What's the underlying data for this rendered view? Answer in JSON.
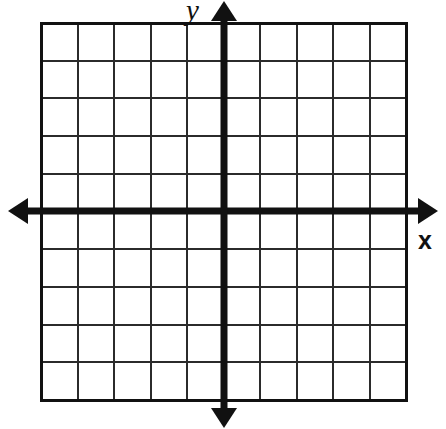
{
  "figure": {
    "kind": "cartesian-coordinate-grid",
    "title": "",
    "background_color": "#ffffff"
  },
  "labels": {
    "x_axis": "x",
    "y_axis": "y"
  },
  "colors": {
    "axis": "#111111",
    "grid_line": "#2b2b2b",
    "grid_border": "#111111",
    "background": "#ffffff"
  },
  "chart_data": {
    "type": "scatter",
    "title": "",
    "xlabel": "x",
    "ylabel": "y",
    "grid": true,
    "legend": "none",
    "series": [],
    "x": [],
    "y": [],
    "xlim": [
      -5,
      5
    ],
    "ylim": [
      -5,
      5
    ],
    "x_ticks": [
      -5,
      -4,
      -3,
      -2,
      -1,
      0,
      1,
      2,
      3,
      4,
      5
    ],
    "y_ticks": [
      -5,
      -4,
      -3,
      -2,
      -1,
      0,
      1,
      2,
      3,
      4,
      5
    ],
    "x_tick_labels": [
      "",
      "",
      "",
      "",
      "",
      "",
      "",
      "",
      "",
      "",
      ""
    ],
    "y_tick_labels": [
      "",
      "",
      "",
      "",
      "",
      "",
      "",
      "",
      "",
      "",
      ""
    ],
    "grid_columns": 10,
    "grid_rows": 10,
    "annotations": []
  },
  "geometry": {
    "canvas_width": 446,
    "canvas_height": 429,
    "grid_left": 41,
    "grid_top": 23,
    "grid_right": 406,
    "grid_bottom": 400,
    "columns": 10,
    "rows": 10,
    "origin_x": 224,
    "origin_y": 211,
    "cell_width": 36.5,
    "cell_height": 37.7,
    "axis_stroke_width": 7,
    "grid_stroke_width": 2,
    "border_stroke_width": 3,
    "x_axis_start": 8,
    "x_axis_end": 438,
    "y_axis_start": 1,
    "y_axis_end": 428,
    "arrowhead_length": 20,
    "arrowhead_half_width": 13
  }
}
